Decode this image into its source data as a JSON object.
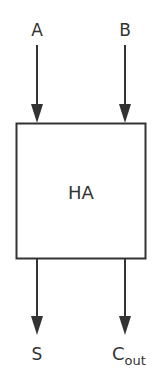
{
  "diagram": {
    "block": {
      "label": "HA"
    },
    "inputs": [
      {
        "label": "A"
      },
      {
        "label": "B"
      }
    ],
    "outputs": [
      {
        "label": "S",
        "subscript": ""
      },
      {
        "label": "C",
        "subscript": "out"
      }
    ],
    "colors": {
      "stroke": "#333333",
      "background": "#ffffff"
    }
  }
}
